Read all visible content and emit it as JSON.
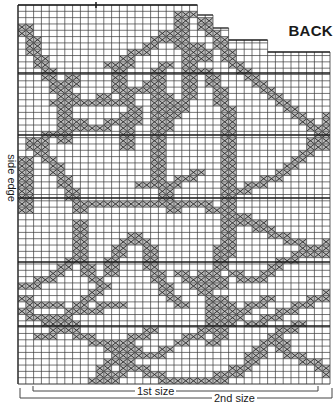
{
  "chart": {
    "title": "BACK",
    "side_label": "side edge",
    "size_labels": {
      "first": "1st size",
      "second": "2nd size"
    },
    "colors": {
      "grid": "#3a3a3a",
      "grid_heavy": "#1a1a1a",
      "stitch": "#2a2a2a",
      "stitch_fill": "#bdbdbd",
      "background": "#ffffff"
    }
  },
  "chart_data": {
    "type": "table",
    "title": "BACK",
    "grid": {
      "columns": 40,
      "rows": 60,
      "left": 18,
      "right": 330,
      "top": 5,
      "bottom": 384,
      "heavy_row_lines_y": [
        73,
        135,
        198,
        262,
        326
      ],
      "stepped_top": [
        {
          "from_col": 0,
          "to_col": 22,
          "top_y": 5
        },
        {
          "from_col": 23,
          "to_col": 24,
          "top_y": 15
        },
        {
          "from_col": 25,
          "to_col": 26,
          "top_y": 28
        },
        {
          "from_col": 27,
          "to_col": 31,
          "top_y": 40
        },
        {
          "from_col": 32,
          "to_col": 39,
          "top_y": 52
        }
      ]
    },
    "annotations": [
      "side edge",
      "1st size",
      "2nd size"
    ],
    "motif_paths": [
      [
        [
          0,
          3
        ],
        [
          1,
          6
        ],
        [
          2,
          9
        ],
        [
          3,
          11
        ],
        [
          4,
          13
        ],
        [
          5,
          14
        ],
        [
          6,
          15
        ]
      ],
      [
        [
          4,
          15
        ],
        [
          6,
          14
        ],
        [
          8,
          15
        ],
        [
          10,
          14
        ],
        [
          12,
          15
        ],
        [
          14,
          13
        ],
        [
          16,
          12
        ],
        [
          17,
          10
        ],
        [
          18,
          9
        ]
      ],
      [
        [
          13,
          14
        ],
        [
          14,
          17
        ],
        [
          13,
          20
        ],
        [
          13,
          22
        ]
      ],
      [
        [
          17,
          12
        ],
        [
          17,
          16
        ],
        [
          17,
          20
        ],
        [
          17,
          24
        ],
        [
          17,
          27
        ],
        [
          18,
          30
        ],
        [
          19,
          32
        ]
      ],
      [
        [
          11,
          9
        ],
        [
          13,
          8
        ],
        [
          16,
          6
        ],
        [
          18,
          4
        ],
        [
          20,
          5
        ],
        [
          22,
          6
        ],
        [
          23,
          8
        ]
      ],
      [
        [
          22,
          1
        ],
        [
          23,
          3
        ],
        [
          24,
          4
        ],
        [
          25,
          6
        ],
        [
          26,
          8
        ],
        [
          27,
          9
        ]
      ],
      [
        [
          20,
          1
        ],
        [
          20,
          5
        ],
        [
          21,
          8
        ],
        [
          21,
          11
        ],
        [
          21,
          13
        ],
        [
          20,
          16
        ]
      ],
      [
        [
          18,
          14
        ],
        [
          19,
          16
        ],
        [
          18,
          18
        ],
        [
          17,
          20
        ]
      ],
      [
        [
          23,
          10
        ],
        [
          24,
          12
        ],
        [
          25,
          14
        ],
        [
          26,
          17
        ],
        [
          26,
          20
        ],
        [
          26,
          25
        ],
        [
          26,
          30
        ],
        [
          26,
          35
        ],
        [
          26,
          38
        ],
        [
          25,
          41
        ]
      ],
      [
        [
          28,
          10
        ],
        [
          30,
          12
        ],
        [
          32,
          14
        ],
        [
          34,
          16
        ],
        [
          36,
          18
        ],
        [
          38,
          20
        ],
        [
          39,
          22
        ]
      ],
      [
        [
          39,
          17
        ],
        [
          38,
          19
        ],
        [
          37,
          21
        ],
        [
          36,
          23
        ],
        [
          35,
          24
        ],
        [
          33,
          26
        ],
        [
          31,
          27
        ],
        [
          29,
          28
        ],
        [
          28,
          29
        ]
      ],
      [
        [
          6,
          11
        ],
        [
          5,
          14
        ],
        [
          5,
          17
        ],
        [
          5,
          21
        ]
      ],
      [
        [
          13,
          8
        ],
        [
          12,
          10
        ],
        [
          12,
          13
        ]
      ],
      [
        [
          15,
          28
        ],
        [
          18,
          28
        ],
        [
          21,
          27
        ],
        [
          22,
          26
        ]
      ],
      [
        [
          1,
          22
        ],
        [
          3,
          20
        ],
        [
          5,
          19
        ],
        [
          7,
          18
        ],
        [
          9,
          19
        ],
        [
          11,
          18
        ],
        [
          13,
          17
        ],
        [
          14,
          17
        ]
      ],
      [
        [
          1,
          21
        ],
        [
          2,
          23
        ],
        [
          3,
          24
        ],
        [
          4,
          26
        ],
        [
          5,
          28
        ],
        [
          6,
          30
        ],
        [
          7,
          32
        ]
      ],
      [
        [
          0,
          24
        ],
        [
          0,
          28
        ],
        [
          0,
          32
        ]
      ],
      [
        [
          7,
          31
        ],
        [
          10,
          31
        ],
        [
          14,
          31
        ],
        [
          18,
          31
        ],
        [
          22,
          31
        ],
        [
          26,
          32
        ],
        [
          28,
          33
        ],
        [
          30,
          34
        ]
      ],
      [
        [
          24,
          32
        ],
        [
          27,
          33
        ],
        [
          29,
          34
        ],
        [
          31,
          35
        ],
        [
          33,
          36
        ],
        [
          35,
          37
        ],
        [
          37,
          38
        ],
        [
          39,
          39
        ]
      ],
      [
        [
          7,
          34
        ],
        [
          7,
          37
        ],
        [
          7,
          40
        ],
        [
          8,
          42
        ],
        [
          9,
          43
        ]
      ],
      [
        [
          11,
          42
        ],
        [
          11,
          40
        ],
        [
          12,
          38
        ],
        [
          13,
          37
        ],
        [
          14,
          36
        ],
        [
          15,
          37
        ]
      ],
      [
        [
          0,
          44
        ],
        [
          2,
          43
        ],
        [
          4,
          42
        ],
        [
          6,
          40
        ],
        [
          7,
          38
        ]
      ],
      [
        [
          15,
          37
        ],
        [
          16,
          39
        ],
        [
          16,
          41
        ],
        [
          17,
          43
        ],
        [
          18,
          45
        ],
        [
          20,
          47
        ]
      ],
      [
        [
          25,
          38
        ],
        [
          25,
          40
        ]
      ],
      [
        [
          0,
          46
        ],
        [
          2,
          47
        ],
        [
          4,
          47
        ]
      ],
      [
        [
          20,
          42
        ],
        [
          22,
          43
        ],
        [
          23,
          45
        ],
        [
          24,
          47
        ],
        [
          24,
          49
        ],
        [
          23,
          51
        ],
        [
          21,
          52
        ],
        [
          20,
          53
        ]
      ],
      [
        [
          27,
          42
        ],
        [
          28,
          43
        ],
        [
          29,
          43
        ],
        [
          31,
          42
        ],
        [
          33,
          40
        ],
        [
          35,
          39
        ],
        [
          37,
          38
        ],
        [
          39,
          37
        ]
      ],
      [
        [
          22,
          44
        ],
        [
          23,
          42
        ],
        [
          24,
          42
        ],
        [
          25,
          44
        ]
      ],
      [
        [
          25,
          46
        ],
        [
          26,
          48
        ],
        [
          25,
          50
        ],
        [
          25,
          52
        ],
        [
          24,
          53
        ]
      ],
      [
        [
          0,
          48
        ],
        [
          2,
          49
        ],
        [
          4,
          50
        ],
        [
          6,
          51
        ],
        [
          8,
          52
        ],
        [
          10,
          53
        ],
        [
          12,
          54
        ],
        [
          14,
          55
        ],
        [
          16,
          55
        ],
        [
          18,
          54
        ]
      ],
      [
        [
          4,
          49
        ],
        [
          6,
          48
        ],
        [
          8,
          46
        ],
        [
          10,
          44
        ]
      ],
      [
        [
          8,
          48
        ],
        [
          10,
          47
        ],
        [
          12,
          47
        ]
      ],
      [
        [
          14,
          54
        ],
        [
          13,
          56
        ],
        [
          12,
          58
        ],
        [
          11,
          59
        ],
        [
          9,
          60
        ],
        [
          7,
          61
        ],
        [
          5,
          62
        ]
      ],
      [
        [
          14,
          52
        ],
        [
          12,
          55
        ],
        [
          10,
          57
        ],
        [
          9,
          59
        ]
      ],
      [
        [
          12,
          53
        ],
        [
          14,
          52
        ],
        [
          16,
          51
        ]
      ],
      [
        [
          15,
          57
        ],
        [
          17,
          58
        ],
        [
          19,
          59
        ],
        [
          21,
          59
        ],
        [
          23,
          59
        ],
        [
          25,
          58
        ],
        [
          27,
          57
        ]
      ],
      [
        [
          29,
          50
        ],
        [
          31,
          49
        ],
        [
          33,
          48
        ],
        [
          35,
          47
        ],
        [
          37,
          46
        ],
        [
          39,
          45
        ]
      ],
      [
        [
          25,
          51
        ],
        [
          27,
          49
        ],
        [
          29,
          47
        ],
        [
          31,
          46
        ]
      ],
      [
        [
          32,
          52
        ],
        [
          33,
          54
        ],
        [
          35,
          55
        ],
        [
          37,
          56
        ],
        [
          39,
          58
        ]
      ],
      [
        [
          29,
          55
        ],
        [
          31,
          53
        ],
        [
          33,
          51
        ],
        [
          35,
          50
        ]
      ],
      [
        [
          2,
          52
        ],
        [
          4,
          51
        ],
        [
          6,
          50
        ]
      ],
      [
        [
          30,
          55
        ],
        [
          28,
          57
        ],
        [
          26,
          58
        ],
        [
          24,
          59
        ]
      ]
    ]
  }
}
